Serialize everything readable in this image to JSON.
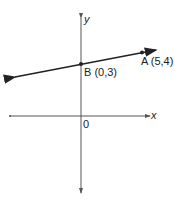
{
  "diagram": {
    "type": "coordinate-plane-line",
    "axes": {
      "x_label": "x",
      "y_label": "y",
      "origin_label": "0"
    },
    "points": [
      {
        "name": "A",
        "label": "A (5,4)",
        "x": 5,
        "y": 4
      },
      {
        "name": "B",
        "label": "B (0,3)",
        "x": 0,
        "y": 3
      }
    ],
    "line": {
      "through": [
        "B",
        "A"
      ],
      "slope": "1/5",
      "y_intercept": 3
    },
    "colors": {
      "stroke": "#222222",
      "axis": "#555555"
    }
  }
}
